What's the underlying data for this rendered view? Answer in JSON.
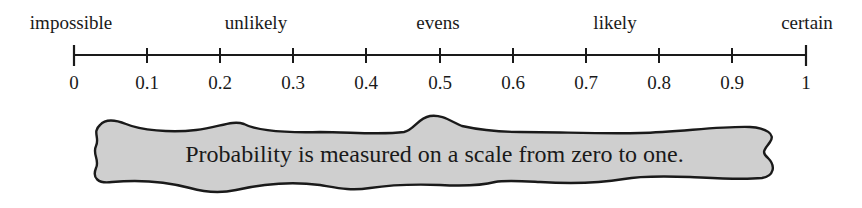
{
  "scale": {
    "min": 0,
    "max": 1,
    "ticks": [
      "0",
      "0.1",
      "0.2",
      "0.3",
      "0.4",
      "0.5",
      "0.6",
      "0.7",
      "0.8",
      "0.9",
      "1"
    ],
    "descriptors": [
      {
        "label": "impossible",
        "value": 0
      },
      {
        "label": "unlikely",
        "value": 0.25
      },
      {
        "label": "evens",
        "value": 0.5
      },
      {
        "label": "likely",
        "value": 0.75
      },
      {
        "label": "certain",
        "value": 1
      }
    ]
  },
  "caption": "Probability is measured on a scale from zero to one.",
  "colors": {
    "line": "#1a1a1a",
    "blob_fill": "#cfcfcf",
    "blob_stroke": "#1a1a1a"
  }
}
